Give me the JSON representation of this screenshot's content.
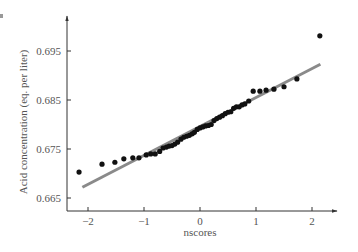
{
  "chart_data": {
    "type": "scatter",
    "title": "",
    "xlabel": "nscores",
    "ylabel": "Acid concentration (eq. per liter)",
    "xlim": [
      -2.4,
      2.4
    ],
    "ylim": [
      0.6625,
      0.7005
    ],
    "x_ticks": [
      -2,
      -1,
      0,
      1,
      2
    ],
    "x_tick_labels": [
      "−2",
      "−1",
      "0",
      "1",
      "2"
    ],
    "y_ticks": [
      0.665,
      0.675,
      0.685,
      0.695
    ],
    "y_tick_labels": [
      "0.665",
      "0.675",
      "0.685",
      "0.695"
    ],
    "grid": false,
    "legend": null,
    "series": [
      {
        "name": "observations",
        "marker": "circle",
        "color": "#111111",
        "points": [
          [
            -2.16,
            0.6703
          ],
          [
            -1.75,
            0.6719
          ],
          [
            -1.52,
            0.6723
          ],
          [
            -1.36,
            0.673
          ],
          [
            -1.2,
            0.6732
          ],
          [
            -1.09,
            0.6732
          ],
          [
            -0.96,
            0.6738
          ],
          [
            -0.88,
            0.674
          ],
          [
            -0.8,
            0.674
          ],
          [
            -0.72,
            0.6745
          ],
          [
            -0.66,
            0.6752
          ],
          [
            -0.6,
            0.6754
          ],
          [
            -0.55,
            0.6756
          ],
          [
            -0.5,
            0.6757
          ],
          [
            -0.45,
            0.676
          ],
          [
            -0.4,
            0.6764
          ],
          [
            -0.34,
            0.677
          ],
          [
            -0.29,
            0.6774
          ],
          [
            -0.24,
            0.6776
          ],
          [
            -0.19,
            0.6778
          ],
          [
            -0.14,
            0.6781
          ],
          [
            -0.1,
            0.6784
          ],
          [
            -0.05,
            0.679
          ],
          [
            0.0,
            0.6793
          ],
          [
            0.05,
            0.6795
          ],
          [
            0.1,
            0.6797
          ],
          [
            0.15,
            0.6798
          ],
          [
            0.2,
            0.68
          ],
          [
            0.25,
            0.6808
          ],
          [
            0.3,
            0.6812
          ],
          [
            0.35,
            0.6815
          ],
          [
            0.4,
            0.6818
          ],
          [
            0.45,
            0.6822
          ],
          [
            0.5,
            0.6825
          ],
          [
            0.55,
            0.6826
          ],
          [
            0.6,
            0.6833
          ],
          [
            0.65,
            0.6836
          ],
          [
            0.7,
            0.6836
          ],
          [
            0.75,
            0.684
          ],
          [
            0.8,
            0.6842
          ],
          [
            0.87,
            0.6848
          ],
          [
            0.95,
            0.6868
          ],
          [
            1.07,
            0.6868
          ],
          [
            1.18,
            0.687
          ],
          [
            1.32,
            0.6872
          ],
          [
            1.5,
            0.6877
          ],
          [
            1.73,
            0.6893
          ],
          [
            2.14,
            0.6981
          ]
        ]
      },
      {
        "name": "reference line",
        "type": "line",
        "color": "#8a8a8a",
        "points": [
          [
            -2.1,
            0.6672
          ],
          [
            2.15,
            0.6923
          ]
        ]
      }
    ]
  },
  "labels": {
    "xlabel": "nscores",
    "ylabel": "Acid concentration (eq. per liter)"
  }
}
